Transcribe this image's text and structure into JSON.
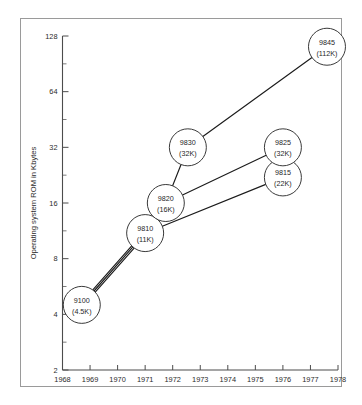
{
  "chart_data": {
    "type": "scatter",
    "title": "",
    "subtitle": "",
    "xlabel": "",
    "ylabel": "Operating system ROM in Kbytes",
    "xlim": [
      1968,
      1978
    ],
    "ylim": [
      2,
      128
    ],
    "yscale": "log2",
    "grid": false,
    "legend": null,
    "x_ticks": [
      "1968",
      "1969",
      "1970",
      "1971",
      "1972",
      "1973",
      "1974",
      "1975",
      "1976",
      "1977",
      "1978"
    ],
    "y_ticks": [
      "2",
      "4",
      "8",
      "16",
      "32",
      "64",
      "128"
    ],
    "y_tick_values": [
      2,
      4,
      8,
      16,
      32,
      64,
      128
    ],
    "points": [
      {
        "id": "9100",
        "label": "9100",
        "sublabel": "(4.5K)",
        "x": 1968.7,
        "y": 4.5,
        "rom_kbytes": 4.5
      },
      {
        "id": "9810",
        "label": "9810",
        "sublabel": "(11K)",
        "x": 1971.0,
        "y": 11,
        "rom_kbytes": 11
      },
      {
        "id": "9820",
        "label": "9820",
        "sublabel": "(16K)",
        "x": 1971.75,
        "y": 16,
        "rom_kbytes": 16
      },
      {
        "id": "9830",
        "label": "9830",
        "sublabel": "(32K)",
        "x": 1972.55,
        "y": 32,
        "rom_kbytes": 32
      },
      {
        "id": "9815",
        "label": "9815",
        "sublabel": "(22K)",
        "x": 1976.0,
        "y": 22,
        "rom_kbytes": 22
      },
      {
        "id": "9825",
        "label": "9825",
        "sublabel": "(32K)",
        "x": 1976.0,
        "y": 32,
        "rom_kbytes": 32
      },
      {
        "id": "9845",
        "label": "9845",
        "sublabel": "(112K)",
        "x": 1977.6,
        "y": 112,
        "rom_kbytes": 112
      }
    ],
    "connections": [
      {
        "from": "9100",
        "to": "9810",
        "offset": -1.6
      },
      {
        "from": "9100",
        "to": "9810",
        "offset": 0
      },
      {
        "from": "9100",
        "to": "9810",
        "offset": 1.6
      },
      {
        "from": "9810",
        "to": "9820",
        "offset": 0
      },
      {
        "from": "9810",
        "to": "9815",
        "offset": 0
      },
      {
        "from": "9820",
        "to": "9830",
        "offset": 0
      },
      {
        "from": "9820",
        "to": "9825",
        "offset": 0
      },
      {
        "from": "9830",
        "to": "9845",
        "offset": 0
      }
    ]
  },
  "colors": {
    "background": "#ffffff",
    "frame": "#9a9a9a",
    "axis": "#4c4c4c",
    "line": "#1b1b1b",
    "node_fill": "#ffffff",
    "node_stroke": "#3a3a3a",
    "text": "#2b2b2b"
  }
}
